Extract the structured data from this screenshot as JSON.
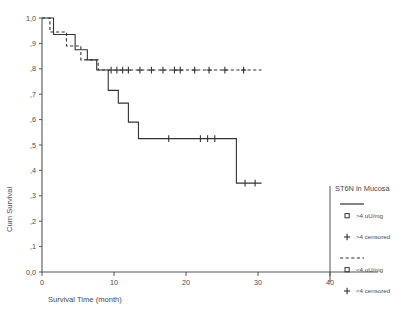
{
  "figure": {
    "partial_top_text": "",
    "axis_color": "#555555",
    "curve_color": "#333333"
  },
  "chart_data": {
    "type": "line",
    "title": "",
    "xlabel": "Survival Time (month)",
    "ylabel": "Cum Survival",
    "xlim": [
      0,
      40
    ],
    "ylim": [
      0,
      1.0
    ],
    "xticks": [
      0,
      10,
      20,
      30,
      40
    ],
    "xtick_labels": [
      "0",
      "10",
      "20",
      "30",
      "40"
    ],
    "yticks": [
      0.0,
      0.1,
      0.2,
      0.3,
      0.4,
      0.5,
      0.6,
      0.7,
      0.8,
      0.9,
      1.0
    ],
    "ytick_labels": [
      "0,0",
      ",1",
      ",2",
      ",3",
      ",4",
      ",5",
      ",6",
      ",7",
      ",8",
      ",9",
      "1,0"
    ],
    "grid": false,
    "legend_position": "right",
    "series": [
      {
        "name": ">4 uU/mg",
        "style": "solid",
        "step": "post",
        "x": [
          0.0,
          1.6,
          1.6,
          4.6,
          4.6,
          6.3,
          6.3,
          7.6,
          7.6,
          9.2,
          9.2,
          10.6,
          10.6,
          12.0,
          12.0,
          13.4,
          13.4,
          15.0,
          15.0,
          27.0,
          27.0,
          30.5
        ],
        "y": [
          1.0,
          1.0,
          0.935,
          0.935,
          0.875,
          0.875,
          0.835,
          0.835,
          0.795,
          0.795,
          0.715,
          0.715,
          0.665,
          0.665,
          0.59,
          0.59,
          0.525,
          0.525,
          0.525,
          0.525,
          0.35,
          0.35
        ],
        "censored_x": [
          17.6,
          22.0,
          23.0,
          24.0,
          28.2,
          29.6
        ],
        "censored_y": [
          0.525,
          0.525,
          0.525,
          0.525,
          0.35,
          0.35
        ]
      },
      {
        "name": "<4 uU/mg",
        "style": "dashed",
        "step": "post",
        "x": [
          0.0,
          1.1,
          1.1,
          3.4,
          3.4,
          5.4,
          5.4,
          7.8,
          7.8,
          30.5
        ],
        "y": [
          1.0,
          1.0,
          0.945,
          0.945,
          0.89,
          0.89,
          0.835,
          0.835,
          0.795,
          0.795
        ],
        "censored_x": [
          9.6,
          10.4,
          11.2,
          12.0,
          13.6,
          15.2,
          16.8,
          18.4,
          19.2,
          21.2,
          23.2,
          25.4,
          28.0
        ],
        "censored_y": [
          0.795,
          0.795,
          0.795,
          0.795,
          0.795,
          0.795,
          0.795,
          0.795,
          0.795,
          0.795,
          0.795,
          0.795,
          0.795
        ]
      }
    ]
  },
  "legend": {
    "title": "ST6N in Mucosa",
    "entries": [
      {
        "marker": "solid-line",
        "label": ""
      },
      {
        "marker": "square",
        "label": ">4 uU/mg"
      },
      {
        "marker": "plus",
        "label": ">4 censored"
      },
      {
        "marker": "dashed-line",
        "label": ""
      },
      {
        "marker": "square",
        "label": "<4 uU/mg"
      },
      {
        "marker": "plus",
        "label": "<4 censored"
      }
    ]
  }
}
